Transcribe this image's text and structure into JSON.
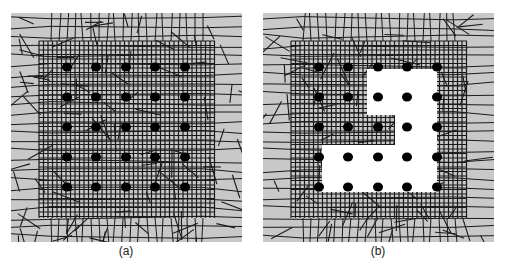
{
  "figure": {
    "panels": [
      {
        "id": "a",
        "caption": "(a)",
        "description": "Quadrilateral finite-element mesh with 5x5 array of refined nodes",
        "node_grid": {
          "rows": 5,
          "cols": 5
        },
        "removed_region": false
      },
      {
        "id": "b",
        "caption": "(b)",
        "description": "Same mesh with stepped L-shaped region of elements removed; 8 nodes remain in the void",
        "node_grid": {
          "rows": 5,
          "cols": 5
        },
        "removed_region": true
      }
    ],
    "colors": {
      "background": "#c8c8c8",
      "mesh_line": "#1a1a1a",
      "node": "#000000",
      "void": "#ffffff"
    }
  }
}
